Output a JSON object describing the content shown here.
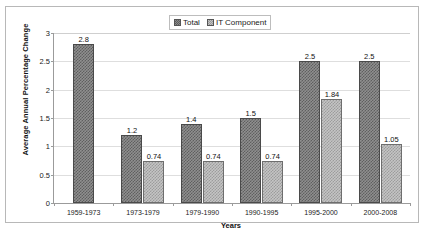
{
  "chart_data": {
    "type": "bar",
    "title": "",
    "xlabel": "Years",
    "ylabel": "Average Annual Percentage Change",
    "categories": [
      "1959-1973",
      "1973-1979",
      "1979-1990",
      "1990-1995",
      "1995-2000",
      "2000-2008"
    ],
    "series": [
      {
        "name": "Total",
        "values": [
          2.8,
          1.2,
          1.4,
          1.5,
          2.5,
          2.5
        ],
        "labels": [
          "2.8",
          "1.2",
          "1.4",
          "1.5",
          "2.5",
          "2.5"
        ],
        "color": "#8f8f8f"
      },
      {
        "name": "IT Component",
        "values": [
          null,
          0.74,
          0.74,
          0.74,
          1.84,
          1.05
        ],
        "labels": [
          "",
          "0.74",
          "0.74",
          "0.74",
          "1.84",
          "1.05"
        ],
        "color": "#c4c4c4"
      }
    ],
    "ylim": [
      0,
      3
    ],
    "yticks": [
      0,
      0.5,
      1,
      1.5,
      2,
      2.5,
      3
    ],
    "ytick_labels": [
      "0",
      "0.5",
      "1",
      "1.5",
      "2",
      "2.5",
      "3"
    ],
    "grid": true,
    "legend_position": "top-center",
    "legend_entries": [
      "Total",
      "IT Component"
    ]
  }
}
